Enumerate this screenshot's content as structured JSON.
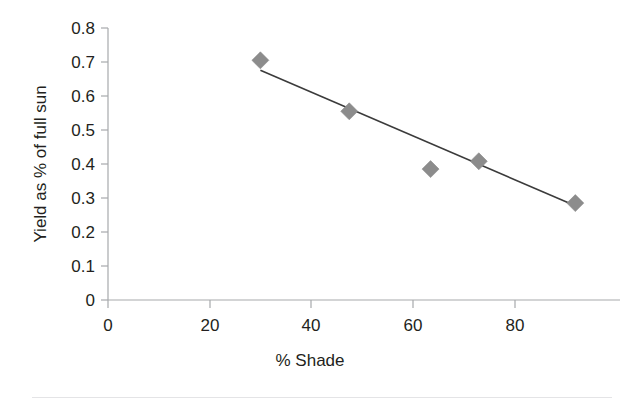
{
  "chart_data": {
    "type": "scatter",
    "title": "",
    "xlabel": "% Shade",
    "ylabel": "Yield as % of full sun",
    "xlim": [
      0,
      100.8
    ],
    "ylim": [
      0,
      0.8
    ],
    "grid": false,
    "legend": null,
    "x_ticks": [
      "0",
      "20",
      "40",
      "60",
      "80"
    ],
    "x_tick_values": [
      0,
      20,
      40,
      60,
      80
    ],
    "y_ticks": [
      "0",
      "0.1",
      "0.2",
      "0.3",
      "0.4",
      "0.5",
      "0.6",
      "0.7",
      "0.8"
    ],
    "y_tick_values": [
      0,
      0.1,
      0.2,
      0.3,
      0.4,
      0.5,
      0.6,
      0.7,
      0.8
    ],
    "series": [
      {
        "name": "Yield vs shade",
        "marker": "diamond",
        "color": "#8c8c8c",
        "points": [
          {
            "x": 30.0,
            "y": 0.705
          },
          {
            "x": 47.5,
            "y": 0.555
          },
          {
            "x": 63.5,
            "y": 0.385
          },
          {
            "x": 73.0,
            "y": 0.408
          },
          {
            "x": 92.0,
            "y": 0.285
          }
        ]
      }
    ],
    "trendline": {
      "name": "linear-fit",
      "color": "#3b3b3b",
      "x_start": 30.0,
      "y_start": 0.676,
      "x_end": 92.0,
      "y_end": 0.277
    }
  },
  "axes": {
    "x_axis_label": "% Shade",
    "y_axis_label": "Yield as % of full sun"
  }
}
